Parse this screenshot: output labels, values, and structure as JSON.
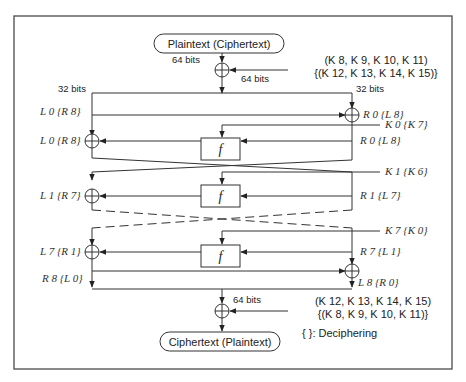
{
  "diagram": {
    "input": {
      "label": "Plaintext (Ciphertext)"
    },
    "output": {
      "label": "Ciphertext (Plaintext)"
    },
    "top_keys": {
      "line1": "(K 8, K 9, K 10, K 11)",
      "line2": "{(K 12, K 13, K 14, K 15)}"
    },
    "bottom_keys": {
      "line1": "(K 12, K 13, K 14, K 15)",
      "line2": "{(K 8, K 9, K 10, K 11)}"
    },
    "bits": {
      "top_in": "64 bits",
      "top_out": "64 bits",
      "left_split": "32 bits",
      "right_split": "32 bits",
      "bottom": "64 bits"
    },
    "labels": {
      "l0_split": "L 0 {R 8}",
      "l0_xor": "L 0 {R 8}",
      "r0_xor": "R 0 {L 8}",
      "k0": "K 0 {K 7}",
      "r0_f": "R 0 {L 8}",
      "k1": "K 1 {K 6}",
      "l1": "L 1 {R 7}",
      "r1": "R 1 {L 7}",
      "k7": "K 7 {K 0}",
      "l7": "L 7 {R 1}",
      "r7": "R 7 {L 1}",
      "r8": "R 8 {L 0}",
      "l8": "L 8 {R 0}"
    },
    "function_label": "f",
    "legend": "{ }: Deciphering"
  }
}
